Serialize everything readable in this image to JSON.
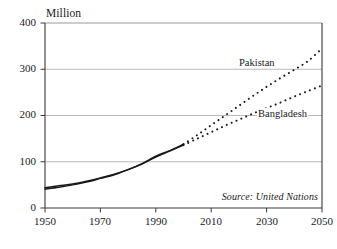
{
  "chart_data": {
    "type": "line",
    "title": "",
    "subtitle": "",
    "unit_label": "Million",
    "xlabel": "",
    "ylabel": "Million",
    "xlim": [
      1950,
      2050
    ],
    "ylim": [
      0,
      400
    ],
    "xticks": [
      "1950",
      "1970",
      "1990",
      "2010",
      "2030",
      "2050"
    ],
    "xtick_values": [
      1950,
      1970,
      1990,
      2010,
      2030,
      2050
    ],
    "yticks": [
      "0",
      "100",
      "200",
      "300",
      "400"
    ],
    "ytick_values": [
      0,
      100,
      200,
      300,
      400
    ],
    "grid": "horizontal",
    "legend_position": "inline-labels",
    "source_note": "Source: United Nations",
    "split_year": 2000,
    "series": [
      {
        "name": "Pakistan",
        "label": "Pakistan",
        "color": "#1a1a1a",
        "style_historic": "solid",
        "style_projection": "dotted",
        "x": [
          1950,
          1955,
          1960,
          1965,
          1970,
          1975,
          1980,
          1985,
          1990,
          1995,
          2000,
          2005,
          2010,
          2015,
          2020,
          2025,
          2030,
          2035,
          2040,
          2045,
          2050
        ],
        "values": [
          41,
          45,
          50,
          56,
          64,
          72,
          83,
          96,
          112,
          124,
          138,
          158,
          179,
          200,
          221,
          242,
          262,
          281,
          299,
          318,
          345
        ]
      },
      {
        "name": "Bangladesh",
        "label": "Bangladesh",
        "color": "#1a1a1a",
        "style_historic": "solid",
        "style_projection": "dotted",
        "x": [
          1950,
          1955,
          1960,
          1965,
          1970,
          1975,
          1980,
          1985,
          1990,
          1995,
          2000,
          2005,
          2010,
          2015,
          2020,
          2025,
          2030,
          2035,
          2040,
          2045,
          2050
        ],
        "values": [
          44,
          48,
          52,
          58,
          65,
          73,
          83,
          95,
          110,
          123,
          136,
          150,
          164,
          178,
          191,
          204,
          216,
          228,
          241,
          253,
          265
        ]
      }
    ],
    "annotations": [
      {
        "name": "pakistan-label",
        "text": "Pakistan"
      },
      {
        "name": "bangladesh-label",
        "text": "Bangladesh"
      },
      {
        "name": "source-note",
        "text": "Source: United Nations"
      }
    ],
    "colors": {
      "line": "#1a1a1a",
      "grid": "#b9b9b9",
      "axis": "#3a3a3a",
      "background": "#ffffff"
    }
  }
}
